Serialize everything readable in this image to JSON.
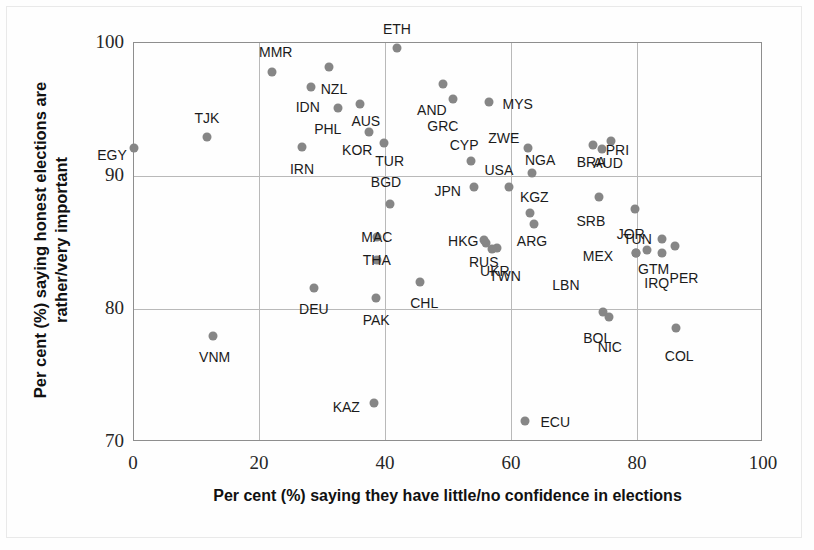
{
  "chart_data": {
    "type": "scatter",
    "title": "",
    "xlabel": "Per cent (%) saying they have little/no confidence in elections",
    "ylabel": "Per cent (%) saying honest elections are rather/very important",
    "xlim": [
      0,
      100
    ],
    "ylim": [
      70,
      100
    ],
    "xticks": [
      "0",
      "20",
      "40",
      "60",
      "80",
      "100"
    ],
    "yticks": [
      "70",
      "80",
      "90",
      "100"
    ],
    "grid": true,
    "legend": "none",
    "marker_color": "#868686",
    "points": [
      {
        "label": "EGY",
        "x": 0.0,
        "y": 92.1,
        "lx": -22,
        "ly": 7
      },
      {
        "label": "TJK",
        "x": 11.6,
        "y": 92.9,
        "lx": 0,
        "ly": -19
      },
      {
        "label": "VNM",
        "x": 12.5,
        "y": 78.0,
        "lx": 2,
        "ly": 21
      },
      {
        "label": "MMR",
        "x": 21.9,
        "y": 97.8,
        "lx": 4,
        "ly": -20
      },
      {
        "label": "DEU",
        "x": 28.6,
        "y": 81.6,
        "lx": 0,
        "ly": 21
      },
      {
        "label": "IRN",
        "x": 26.7,
        "y": 92.2,
        "lx": 0,
        "ly": 22
      },
      {
        "label": "IDN",
        "x": 28.1,
        "y": 96.7,
        "lx": -3,
        "ly": 20
      },
      {
        "label": "NZL",
        "x": 31.0,
        "y": 98.2,
        "lx": 5,
        "ly": 22
      },
      {
        "label": "PHL",
        "x": 32.4,
        "y": 95.1,
        "lx": -10,
        "ly": 21
      },
      {
        "label": "AUS",
        "x": 35.9,
        "y": 95.4,
        "lx": 6,
        "ly": 17
      },
      {
        "label": "KOR",
        "x": 37.4,
        "y": 93.3,
        "lx": -12,
        "ly": 18
      },
      {
        "label": "TUR",
        "x": 39.7,
        "y": 92.5,
        "lx": 6,
        "ly": 18
      },
      {
        "label": "ETH",
        "x": 41.8,
        "y": 99.6,
        "lx": 0,
        "ly": -19
      },
      {
        "label": "BGD",
        "x": 40.7,
        "y": 87.9,
        "lx": -4,
        "ly": -22
      },
      {
        "label": "MAC",
        "x": 38.6,
        "y": 85.4,
        "lx": 0,
        "ly": 0
      },
      {
        "label": "THA",
        "x": 38.6,
        "y": 83.7,
        "lx": 0,
        "ly": 0
      },
      {
        "label": "PAK",
        "x": 38.5,
        "y": 80.8,
        "lx": 0,
        "ly": 22
      },
      {
        "label": "KAZ",
        "x": 38.2,
        "y": 72.9,
        "lx": -28,
        "ly": 4
      },
      {
        "label": "CHL",
        "x": 45.5,
        "y": 82.0,
        "lx": 4,
        "ly": 21
      },
      {
        "label": "AND",
        "x": 49.1,
        "y": 96.9,
        "lx": -11,
        "ly": 26
      },
      {
        "label": "GRC",
        "x": 50.7,
        "y": 95.8,
        "lx": -10,
        "ly": 27
      },
      {
        "label": "MYS",
        "x": 56.4,
        "y": 95.6,
        "lx": 29,
        "ly": 2
      },
      {
        "label": "CYP",
        "x": 53.6,
        "y": 91.1,
        "lx": -7,
        "ly": -16
      },
      {
        "label": "ZWE",
        "x": 62.6,
        "y": 92.1,
        "lx": -24,
        "ly": -10
      },
      {
        "label": "USA",
        "x": 59.6,
        "y": 89.2,
        "lx": -10,
        "ly": -17
      },
      {
        "label": "JPN",
        "x": 54.0,
        "y": 89.2,
        "lx": -26,
        "ly": 4
      },
      {
        "label": "NGA",
        "x": 63.3,
        "y": 90.2,
        "lx": 8,
        "ly": -13
      },
      {
        "label": "KGZ",
        "x": 63.0,
        "y": 87.2,
        "lx": 4,
        "ly": -16
      },
      {
        "label": "HKG",
        "x": 56.0,
        "y": 85.0,
        "lx": -23,
        "ly": -2
      },
      {
        "label": "ARG",
        "x": 63.6,
        "y": 86.4,
        "lx": -2,
        "ly": 17
      },
      {
        "label": "TWN",
        "x": 57.7,
        "y": 84.6,
        "lx": 8,
        "ly": 28
      },
      {
        "label": "RUS",
        "x": 55.6,
        "y": 85.2,
        "lx": 0,
        "ly": 22
      },
      {
        "label": "UKR",
        "x": 56.9,
        "y": 84.5,
        "lx": 3,
        "ly": 22
      },
      {
        "label": "ECU",
        "x": 62.2,
        "y": 71.6,
        "lx": 30,
        "ly": 1
      },
      {
        "label": "BRA",
        "x": 73.0,
        "y": 92.3,
        "lx": -2,
        "ly": 17
      },
      {
        "label": "PRI",
        "x": 75.9,
        "y": 92.6,
        "lx": 6,
        "ly": 9
      },
      {
        "label": "AUD",
        "x": 74.4,
        "y": 92.0,
        "lx": 6,
        "ly": 14
      },
      {
        "label": "SRB",
        "x": 73.9,
        "y": 88.4,
        "lx": -8,
        "ly": 24
      },
      {
        "label": "JOR",
        "x": 79.6,
        "y": 87.5,
        "lx": -4,
        "ly": 25
      },
      {
        "label": "TUN",
        "x": 84.0,
        "y": 85.3,
        "lx": -25,
        "ly": 0
      },
      {
        "label": "MEX",
        "x": 79.8,
        "y": 84.2,
        "lx": -38,
        "ly": 3
      },
      {
        "label": "GTM",
        "x": 81.5,
        "y": 84.4,
        "lx": 7,
        "ly": 19
      },
      {
        "label": "IRQ",
        "x": 83.9,
        "y": 84.2,
        "lx": -5,
        "ly": 30
      },
      {
        "label": "PER",
        "x": 86.0,
        "y": 84.7,
        "lx": 9,
        "ly": 32
      },
      {
        "label": "LBN",
        "x": 79.8,
        "y": 84.2,
        "lx": -70,
        "ly": 32
      },
      {
        "label": "BOL",
        "x": 74.6,
        "y": 79.8,
        "lx": -6,
        "ly": 26
      },
      {
        "label": "NIC",
        "x": 75.5,
        "y": 79.4,
        "lx": 1,
        "ly": 30
      },
      {
        "label": "COL",
        "x": 86.2,
        "y": 78.6,
        "lx": 3,
        "ly": 28
      }
    ]
  }
}
